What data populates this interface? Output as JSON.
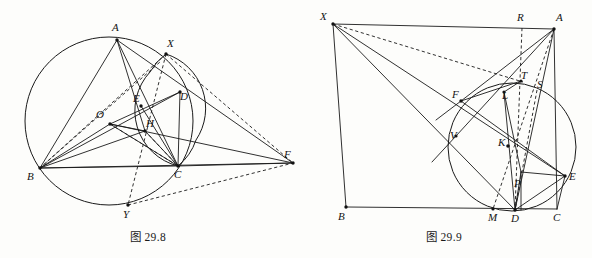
{
  "page": {
    "background_color": "#fdfdfb",
    "ink_color": "#1a1a1a",
    "width": 592,
    "height": 258
  },
  "figures": [
    {
      "id": "fig-29-8",
      "caption": "图 29.8",
      "description": "Triangle ABC inscribed in a circle with center O, orthocenter H, point D, midpoint E, external point F, and circle intersections X and Y.",
      "circles": [
        {
          "name": "circumcircle-ABC",
          "cx": 109,
          "cy": 121,
          "r": 84,
          "style": "solid"
        },
        {
          "name": "circle-XDC",
          "cx": 172,
          "cy": 110,
          "r": 57,
          "style": "solid"
        }
      ],
      "points": [
        {
          "label": "A",
          "x": 117,
          "y": 40,
          "lx": 112,
          "ly": 31,
          "dot": true
        },
        {
          "label": "X",
          "x": 166,
          "y": 54,
          "lx": 167,
          "ly": 47,
          "dot": true
        },
        {
          "label": "D",
          "x": 180,
          "y": 92,
          "lx": 180,
          "ly": 100,
          "dot": true
        },
        {
          "label": "E",
          "x": 141,
          "y": 106,
          "lx": 136,
          "ly": 102,
          "dot": true
        },
        {
          "label": "O",
          "x": 110,
          "y": 124,
          "lx": 99,
          "ly": 117,
          "dot": true
        },
        {
          "label": "H",
          "x": 145,
          "y": 131,
          "lx": 146,
          "ly": 127,
          "dot": true
        },
        {
          "label": "B",
          "x": 40,
          "y": 168,
          "lx": 29,
          "ly": 178,
          "dot": true
        },
        {
          "label": "C",
          "x": 178,
          "y": 166,
          "lx": 175,
          "ly": 177,
          "dot": true
        },
        {
          "label": "F",
          "x": 293,
          "y": 163,
          "lx": 296,
          "ly": 166,
          "dot": true
        },
        {
          "label": "Y",
          "x": 128,
          "y": 205,
          "lx": 124,
          "ly": 217,
          "dot": true
        }
      ],
      "solid_segments": [
        {
          "name": "A-B",
          "from": "A",
          "to": "B"
        },
        {
          "name": "B-C",
          "from": "B",
          "to": "C"
        },
        {
          "name": "A-C",
          "from": "A",
          "to": "C"
        },
        {
          "name": "A-F",
          "from": "A",
          "to": "F"
        },
        {
          "name": "B-F",
          "from": "B",
          "to": "F"
        },
        {
          "name": "C-F",
          "from": "C",
          "to": "F"
        },
        {
          "name": "A-H",
          "from": "A",
          "to": "H"
        },
        {
          "name": "B-H",
          "from": "B",
          "to": "H"
        },
        {
          "name": "C-H",
          "from": "C",
          "to": "H"
        },
        {
          "name": "O-H",
          "from": "O",
          "to": "H"
        },
        {
          "name": "O-B",
          "from": "O",
          "to": "B"
        },
        {
          "name": "O-C",
          "from": "O",
          "to": "C"
        },
        {
          "name": "O-D",
          "from": "O",
          "to": "D"
        },
        {
          "name": "E-C",
          "from": "E",
          "to": "C"
        },
        {
          "name": "D-C",
          "from": "D",
          "to": "C"
        },
        {
          "name": "B-D",
          "from": "B",
          "to": "D"
        },
        {
          "name": "A-D-F",
          "from": "A",
          "to": "F"
        }
      ],
      "dashed_segments": [
        {
          "name": "X-B",
          "from": "X",
          "to": "B"
        },
        {
          "name": "X-Y",
          "from": "X",
          "to": "Y"
        },
        {
          "name": "X-F",
          "from": "X",
          "to": "F"
        },
        {
          "name": "Y-F",
          "from": "Y",
          "to": "F"
        },
        {
          "name": "B-X-upper",
          "from": "B",
          "to": "X"
        },
        {
          "name": "H-C-dash",
          "from": "H",
          "to": "C"
        }
      ]
    },
    {
      "id": "fig-29-9",
      "caption": "图 29.9",
      "description": "Quadrilateral configuration with external point X, circle tangent to BC at D, points F, V, K, L, T, S, P, M, R and E.",
      "circles": [
        {
          "name": "incircle-tangent-BC",
          "cx": 512,
          "cy": 147,
          "r": 65,
          "style": "solid"
        }
      ],
      "points": [
        {
          "label": "X",
          "x": 333,
          "y": 24,
          "lx": 322,
          "ly": 20,
          "dot": true
        },
        {
          "label": "R",
          "x": 522,
          "y": 28,
          "lx": 517,
          "ly": 20,
          "dot": false
        },
        {
          "label": "A",
          "x": 554,
          "y": 29,
          "lx": 556,
          "ly": 20,
          "dot": true
        },
        {
          "label": "T",
          "x": 519,
          "y": 84,
          "lx": 521,
          "ly": 80,
          "dot": true
        },
        {
          "label": "S",
          "x": 537,
          "y": 90,
          "lx": 538,
          "ly": 86,
          "dot": false
        },
        {
          "label": "L",
          "x": 504,
          "y": 92,
          "lx": 502,
          "ly": 96,
          "dot": true
        },
        {
          "label": "F",
          "x": 461,
          "y": 101,
          "lx": 456,
          "ly": 97,
          "dot": true
        },
        {
          "label": "V",
          "x": 456,
          "y": 136,
          "lx": 454,
          "ly": 133,
          "dot": true
        },
        {
          "label": "K",
          "x": 508,
          "y": 146,
          "lx": 500,
          "ly": 145,
          "dot": true
        },
        {
          "label": "P",
          "x": 521,
          "y": 180,
          "lx": 518,
          "ly": 186,
          "dot": false
        },
        {
          "label": "E",
          "x": 565,
          "y": 176,
          "lx": 569,
          "ly": 179,
          "dot": true
        },
        {
          "label": "B",
          "x": 346,
          "y": 207,
          "lx": 339,
          "ly": 219,
          "dot": true
        },
        {
          "label": "M",
          "x": 493,
          "y": 209,
          "lx": 489,
          "ly": 220,
          "dot": true
        },
        {
          "label": "D",
          "x": 515,
          "y": 210,
          "lx": 512,
          "ly": 221,
          "dot": true
        },
        {
          "label": "C",
          "x": 557,
          "y": 209,
          "lx": 554,
          "ly": 221,
          "dot": false
        }
      ],
      "solid_segments": [
        {
          "name": "X-A",
          "from": "X",
          "to": "A"
        },
        {
          "name": "X-E",
          "from": "X",
          "to": "E"
        },
        {
          "name": "X-D",
          "from": "X",
          "to": "D"
        },
        {
          "name": "X-B-edge",
          "from": "X",
          "to": "B"
        },
        {
          "name": "B-C",
          "from": "B",
          "to": "C"
        },
        {
          "name": "A-C",
          "from": "A",
          "to": "C"
        },
        {
          "name": "A-D",
          "from": "A",
          "to": "D"
        },
        {
          "name": "A-M",
          "from": "A",
          "to": "M"
        },
        {
          "name": "A-V",
          "from": "A",
          "to": "V"
        },
        {
          "name": "L-D",
          "from": "L",
          "to": "D"
        },
        {
          "name": "F-E",
          "from": "F",
          "to": "E"
        },
        {
          "name": "P-E",
          "from": "P",
          "to": "E"
        },
        {
          "name": "P-D",
          "from": "P",
          "to": "D"
        },
        {
          "name": "L-P",
          "from": "L",
          "to": "P"
        },
        {
          "name": "D-E",
          "from": "D",
          "to": "E"
        },
        {
          "name": "F-T",
          "from": "F",
          "to": "T"
        }
      ],
      "dashed_segments": [
        {
          "name": "X-T",
          "from": "X",
          "to": "T"
        },
        {
          "name": "R-D",
          "from": "R",
          "to": "D"
        },
        {
          "name": "A-K-M",
          "from": "A",
          "to": "M"
        },
        {
          "name": "S-D",
          "from": "S",
          "to": "D"
        },
        {
          "name": "K-M",
          "from": "K",
          "to": "M"
        }
      ]
    }
  ]
}
